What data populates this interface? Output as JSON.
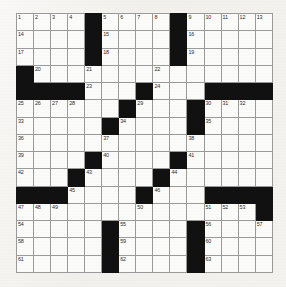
{
  "puzzle": {
    "title": "Crossword Grid",
    "size": {
      "rows": 15,
      "cols": 15
    },
    "colors": {
      "block": "#111111",
      "cell": "#fbfbf9",
      "grid_line": "#9a9a9a",
      "page_background": "#f1f0ec",
      "number_text": "#2a2a2a"
    },
    "grid": [
      [
        {
          "block": false,
          "num": "1"
        },
        {
          "block": false,
          "num": "2"
        },
        {
          "block": false,
          "num": "3"
        },
        {
          "block": false,
          "num": "4"
        },
        {
          "block": true,
          "num": ""
        },
        {
          "block": false,
          "num": "5"
        },
        {
          "block": false,
          "num": "6"
        },
        {
          "block": false,
          "num": "7"
        },
        {
          "block": false,
          "num": "8"
        },
        {
          "block": true,
          "num": ""
        },
        {
          "block": false,
          "num": "9"
        },
        {
          "block": false,
          "num": "10"
        },
        {
          "block": false,
          "num": "11"
        },
        {
          "block": false,
          "num": "12"
        },
        {
          "block": false,
          "num": "13"
        }
      ],
      [
        {
          "block": false,
          "num": "14"
        },
        {
          "block": false,
          "num": ""
        },
        {
          "block": false,
          "num": ""
        },
        {
          "block": false,
          "num": ""
        },
        {
          "block": true,
          "num": ""
        },
        {
          "block": false,
          "num": "15"
        },
        {
          "block": false,
          "num": ""
        },
        {
          "block": false,
          "num": ""
        },
        {
          "block": false,
          "num": ""
        },
        {
          "block": true,
          "num": ""
        },
        {
          "block": false,
          "num": "16"
        },
        {
          "block": false,
          "num": ""
        },
        {
          "block": false,
          "num": ""
        },
        {
          "block": false,
          "num": ""
        },
        {
          "block": false,
          "num": ""
        }
      ],
      [
        {
          "block": false,
          "num": "17"
        },
        {
          "block": false,
          "num": ""
        },
        {
          "block": false,
          "num": ""
        },
        {
          "block": false,
          "num": ""
        },
        {
          "block": true,
          "num": ""
        },
        {
          "block": false,
          "num": "18"
        },
        {
          "block": false,
          "num": ""
        },
        {
          "block": false,
          "num": ""
        },
        {
          "block": false,
          "num": ""
        },
        {
          "block": true,
          "num": ""
        },
        {
          "block": false,
          "num": "19"
        },
        {
          "block": false,
          "num": ""
        },
        {
          "block": false,
          "num": ""
        },
        {
          "block": false,
          "num": ""
        },
        {
          "block": false,
          "num": ""
        }
      ],
      [
        {
          "block": true,
          "num": ""
        },
        {
          "block": false,
          "num": "20"
        },
        {
          "block": false,
          "num": ""
        },
        {
          "block": false,
          "num": ""
        },
        {
          "block": false,
          "num": "21"
        },
        {
          "block": false,
          "num": ""
        },
        {
          "block": false,
          "num": ""
        },
        {
          "block": false,
          "num": ""
        },
        {
          "block": false,
          "num": "22"
        },
        {
          "block": false,
          "num": ""
        },
        {
          "block": false,
          "num": ""
        },
        {
          "block": false,
          "num": ""
        },
        {
          "block": false,
          "num": ""
        },
        {
          "block": false,
          "num": ""
        },
        {
          "block": false,
          "num": ""
        }
      ],
      [
        {
          "block": true,
          "num": ""
        },
        {
          "block": true,
          "num": ""
        },
        {
          "block": true,
          "num": ""
        },
        {
          "block": true,
          "num": ""
        },
        {
          "block": false,
          "num": "23"
        },
        {
          "block": false,
          "num": ""
        },
        {
          "block": false,
          "num": ""
        },
        {
          "block": true,
          "num": ""
        },
        {
          "block": false,
          "num": "24"
        },
        {
          "block": false,
          "num": ""
        },
        {
          "block": false,
          "num": ""
        },
        {
          "block": true,
          "num": ""
        },
        {
          "block": true,
          "num": ""
        },
        {
          "block": true,
          "num": ""
        },
        {
          "block": true,
          "num": ""
        }
      ],
      [
        {
          "block": false,
          "num": "25"
        },
        {
          "block": false,
          "num": "26"
        },
        {
          "block": false,
          "num": "27"
        },
        {
          "block": false,
          "num": "28"
        },
        {
          "block": false,
          "num": ""
        },
        {
          "block": false,
          "num": ""
        },
        {
          "block": true,
          "num": ""
        },
        {
          "block": false,
          "num": "29"
        },
        {
          "block": false,
          "num": ""
        },
        {
          "block": false,
          "num": ""
        },
        {
          "block": true,
          "num": ""
        },
        {
          "block": false,
          "num": "30"
        },
        {
          "block": false,
          "num": "31"
        },
        {
          "block": false,
          "num": "32"
        },
        {
          "block": false,
          "num": ""
        }
      ],
      [
        {
          "block": false,
          "num": "33"
        },
        {
          "block": false,
          "num": ""
        },
        {
          "block": false,
          "num": ""
        },
        {
          "block": false,
          "num": ""
        },
        {
          "block": false,
          "num": ""
        },
        {
          "block": true,
          "num": ""
        },
        {
          "block": false,
          "num": "34"
        },
        {
          "block": false,
          "num": ""
        },
        {
          "block": false,
          "num": ""
        },
        {
          "block": false,
          "num": ""
        },
        {
          "block": true,
          "num": ""
        },
        {
          "block": false,
          "num": "35"
        },
        {
          "block": false,
          "num": ""
        },
        {
          "block": false,
          "num": ""
        },
        {
          "block": false,
          "num": ""
        }
      ],
      [
        {
          "block": false,
          "num": "36"
        },
        {
          "block": false,
          "num": ""
        },
        {
          "block": false,
          "num": ""
        },
        {
          "block": false,
          "num": ""
        },
        {
          "block": false,
          "num": ""
        },
        {
          "block": false,
          "num": "37"
        },
        {
          "block": false,
          "num": ""
        },
        {
          "block": false,
          "num": ""
        },
        {
          "block": false,
          "num": ""
        },
        {
          "block": false,
          "num": ""
        },
        {
          "block": false,
          "num": "38"
        },
        {
          "block": false,
          "num": ""
        },
        {
          "block": false,
          "num": ""
        },
        {
          "block": false,
          "num": ""
        },
        {
          "block": false,
          "num": ""
        }
      ],
      [
        {
          "block": false,
          "num": "39"
        },
        {
          "block": false,
          "num": ""
        },
        {
          "block": false,
          "num": ""
        },
        {
          "block": false,
          "num": ""
        },
        {
          "block": true,
          "num": ""
        },
        {
          "block": false,
          "num": "40"
        },
        {
          "block": false,
          "num": ""
        },
        {
          "block": false,
          "num": ""
        },
        {
          "block": false,
          "num": ""
        },
        {
          "block": true,
          "num": ""
        },
        {
          "block": false,
          "num": "41"
        },
        {
          "block": false,
          "num": ""
        },
        {
          "block": false,
          "num": ""
        },
        {
          "block": false,
          "num": ""
        },
        {
          "block": false,
          "num": ""
        }
      ],
      [
        {
          "block": false,
          "num": "42"
        },
        {
          "block": false,
          "num": ""
        },
        {
          "block": false,
          "num": ""
        },
        {
          "block": true,
          "num": ""
        },
        {
          "block": false,
          "num": "43"
        },
        {
          "block": false,
          "num": ""
        },
        {
          "block": false,
          "num": ""
        },
        {
          "block": false,
          "num": ""
        },
        {
          "block": true,
          "num": ""
        },
        {
          "block": false,
          "num": "44"
        },
        {
          "block": false,
          "num": ""
        },
        {
          "block": false,
          "num": ""
        },
        {
          "block": false,
          "num": ""
        },
        {
          "block": false,
          "num": ""
        },
        {
          "block": false,
          "num": ""
        }
      ],
      [
        {
          "block": true,
          "num": ""
        },
        {
          "block": true,
          "num": ""
        },
        {
          "block": true,
          "num": ""
        },
        {
          "block": false,
          "num": "45"
        },
        {
          "block": false,
          "num": ""
        },
        {
          "block": false,
          "num": ""
        },
        {
          "block": false,
          "num": ""
        },
        {
          "block": true,
          "num": ""
        },
        {
          "block": false,
          "num": "46"
        },
        {
          "block": false,
          "num": ""
        },
        {
          "block": false,
          "num": ""
        },
        {
          "block": true,
          "num": ""
        },
        {
          "block": true,
          "num": ""
        },
        {
          "block": true,
          "num": ""
        },
        {
          "block": true,
          "num": ""
        }
      ],
      [
        {
          "block": false,
          "num": "47"
        },
        {
          "block": false,
          "num": "48"
        },
        {
          "block": false,
          "num": "49"
        },
        {
          "block": false,
          "num": ""
        },
        {
          "block": false,
          "num": ""
        },
        {
          "block": false,
          "num": ""
        },
        {
          "block": false,
          "num": ""
        },
        {
          "block": false,
          "num": "50"
        },
        {
          "block": false,
          "num": ""
        },
        {
          "block": false,
          "num": ""
        },
        {
          "block": false,
          "num": ""
        },
        {
          "block": false,
          "num": "51"
        },
        {
          "block": false,
          "num": "52"
        },
        {
          "block": false,
          "num": "53"
        },
        {
          "block": true,
          "num": ""
        }
      ],
      [
        {
          "block": false,
          "num": "54"
        },
        {
          "block": false,
          "num": ""
        },
        {
          "block": false,
          "num": ""
        },
        {
          "block": false,
          "num": ""
        },
        {
          "block": false,
          "num": ""
        },
        {
          "block": true,
          "num": ""
        },
        {
          "block": false,
          "num": "55"
        },
        {
          "block": false,
          "num": ""
        },
        {
          "block": false,
          "num": ""
        },
        {
          "block": false,
          "num": ""
        },
        {
          "block": true,
          "num": ""
        },
        {
          "block": false,
          "num": "56"
        },
        {
          "block": false,
          "num": ""
        },
        {
          "block": false,
          "num": ""
        },
        {
          "block": false,
          "num": "57"
        }
      ],
      [
        {
          "block": false,
          "num": "58"
        },
        {
          "block": false,
          "num": ""
        },
        {
          "block": false,
          "num": ""
        },
        {
          "block": false,
          "num": ""
        },
        {
          "block": false,
          "num": ""
        },
        {
          "block": true,
          "num": ""
        },
        {
          "block": false,
          "num": "59"
        },
        {
          "block": false,
          "num": ""
        },
        {
          "block": false,
          "num": ""
        },
        {
          "block": false,
          "num": ""
        },
        {
          "block": true,
          "num": ""
        },
        {
          "block": false,
          "num": "60"
        },
        {
          "block": false,
          "num": ""
        },
        {
          "block": false,
          "num": ""
        },
        {
          "block": false,
          "num": ""
        }
      ],
      [
        {
          "block": false,
          "num": "61"
        },
        {
          "block": false,
          "num": ""
        },
        {
          "block": false,
          "num": ""
        },
        {
          "block": false,
          "num": ""
        },
        {
          "block": false,
          "num": ""
        },
        {
          "block": true,
          "num": ""
        },
        {
          "block": false,
          "num": "62"
        },
        {
          "block": false,
          "num": ""
        },
        {
          "block": false,
          "num": ""
        },
        {
          "block": false,
          "num": ""
        },
        {
          "block": true,
          "num": ""
        },
        {
          "block": false,
          "num": "63"
        },
        {
          "block": false,
          "num": ""
        },
        {
          "block": false,
          "num": ""
        },
        {
          "block": false,
          "num": ""
        }
      ]
    ]
  }
}
